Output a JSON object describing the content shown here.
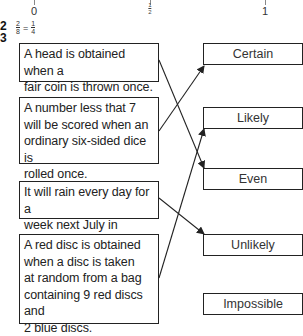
{
  "number_line": {
    "labels": [
      {
        "text": "0",
        "x": 34
      },
      {
        "text": "1/2",
        "numerator": "1",
        "denominator": "2",
        "x": 150
      },
      {
        "text": "1",
        "x": 265
      }
    ]
  },
  "question_2": {
    "number": "2",
    "answer": {
      "lhs_num": "2",
      "lhs_den": "8",
      "equals": "=",
      "rhs_num": "1",
      "rhs_den": "4"
    }
  },
  "question_3": {
    "number": "3",
    "events": [
      {
        "text": "A head is obtained when a fair coin is thrown once.",
        "lines": [
          "A head is obtained when a",
          "fair coin is thrown once."
        ],
        "matches": "Even"
      },
      {
        "text": "A number less that 7 will be scored when an ordinary six-sided dice is rolled once.",
        "lines": [
          "A number less that 7",
          "will be scored when an",
          "ordinary six-sided dice is",
          "rolled once."
        ],
        "matches": "Certain"
      },
      {
        "text": "It will rain every day for a week next July in London.",
        "lines": [
          "It will rain every day for a",
          "week next July in London."
        ],
        "matches": "Unlikely"
      },
      {
        "text": "A red disc is obtained when a disc is taken at random from a bag containing 9 red discs and 2 blue discs.",
        "lines": [
          "A red disc is obtained",
          "when a disc is taken",
          "at random from a bag",
          "containing 9 red discs and",
          "2 blue discs."
        ],
        "matches": "Likely"
      }
    ],
    "likelihoods": [
      "Certain",
      "Likely",
      "Even",
      "Unlikely",
      "Impossible"
    ]
  },
  "colors": {
    "line": "#222222",
    "text": "#222222",
    "background": "#ffffff"
  }
}
